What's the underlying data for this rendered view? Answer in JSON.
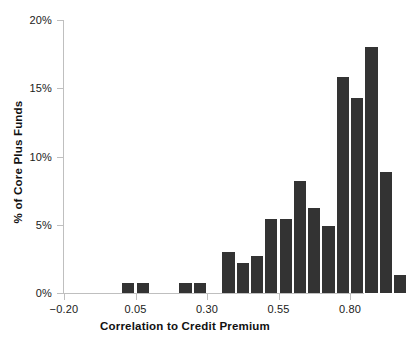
{
  "chart_data": {
    "type": "bar",
    "title": "",
    "subtitle": "",
    "xlabel": "Correlation to Credit Premium",
    "ylabel": "% of Core Plus Funds",
    "xlim": [
      -0.2,
      0.9
    ],
    "ylim": [
      0,
      20
    ],
    "grid": false,
    "legend": null,
    "bin_width": 0.05,
    "bar_color": "#333333",
    "axis_color": "#bfbfbf",
    "x_ticks": [
      {
        "value": -0.2,
        "label": "−0.20"
      },
      {
        "value": 0.05,
        "label": "0.05"
      },
      {
        "value": 0.3,
        "label": "0.30"
      },
      {
        "value": 0.55,
        "label": "0.55"
      },
      {
        "value": 0.8,
        "label": "0.80"
      }
    ],
    "y_ticks": [
      {
        "value": 0,
        "label": "0%"
      },
      {
        "value": 5,
        "label": "5%"
      },
      {
        "value": 10,
        "label": "10%"
      },
      {
        "value": 15,
        "label": "15%"
      },
      {
        "value": 20,
        "label": "20%"
      }
    ],
    "bins": [
      {
        "x0": 0.0,
        "x1": 0.05,
        "value": 0.7
      },
      {
        "x0": 0.05,
        "x1": 0.1,
        "value": 0.7
      },
      {
        "x0": 0.2,
        "x1": 0.25,
        "value": 0.7
      },
      {
        "x0": 0.25,
        "x1": 0.3,
        "value": 0.7
      },
      {
        "x0": 0.35,
        "x1": 0.4,
        "value": 3.0
      },
      {
        "x0": 0.4,
        "x1": 0.45,
        "value": 2.2
      },
      {
        "x0": 0.45,
        "x1": 0.5,
        "value": 2.7
      },
      {
        "x0": 0.5,
        "x1": 0.55,
        "value": 5.4
      },
      {
        "x0": 0.55,
        "x1": 0.6,
        "value": 5.4
      },
      {
        "x0": 0.6,
        "x1": 0.65,
        "value": 8.2
      },
      {
        "x0": 0.65,
        "x1": 0.7,
        "value": 6.2
      },
      {
        "x0": 0.7,
        "x1": 0.75,
        "value": 4.9
      },
      {
        "x0": 0.75,
        "x1": 0.8,
        "value": 15.8
      },
      {
        "x0": 0.8,
        "x1": 0.85,
        "value": 14.3
      },
      {
        "x0": 0.85,
        "x1": 0.9,
        "value": 18.0
      },
      {
        "x0": 0.9,
        "x1": 0.95,
        "value": 8.9
      },
      {
        "x0": 0.95,
        "x1": 1.0,
        "value": 1.3
      }
    ],
    "categories": [
      "0.00–0.05",
      "0.05–0.10",
      "0.20–0.25",
      "0.25–0.30",
      "0.35–0.40",
      "0.40–0.45",
      "0.45–0.50",
      "0.50–0.55",
      "0.55–0.60",
      "0.60–0.65",
      "0.65–0.70",
      "0.70–0.75",
      "0.75–0.80",
      "0.80–0.85",
      "0.85–0.90",
      "0.90–0.95",
      "0.95–1.00"
    ],
    "values": [
      0.7,
      0.7,
      0.7,
      0.7,
      3.0,
      2.2,
      2.7,
      5.4,
      5.4,
      8.2,
      6.2,
      4.9,
      15.8,
      14.3,
      18.0,
      8.9,
      1.3
    ]
  }
}
